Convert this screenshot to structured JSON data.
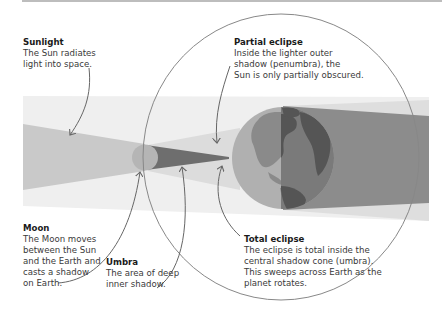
{
  "diagram": {
    "topic": "Solar eclipse",
    "colors": {
      "background": "#ffffff",
      "light_band": "#efefef",
      "sunlight": "#c9c9c9",
      "penumbra": "#dcdcdc",
      "umbra": "#6e6e6e",
      "moon": "#b5b5b5",
      "earth_lit": "#b0b0b0",
      "earth_land_lit": "#8a8a8a",
      "earth_shadow": "#7a7a7a",
      "earth_land_shadow": "#555555",
      "shadow_dark": "#8c8c8c",
      "shadow_light": "#dedede",
      "arrows": "#666666",
      "top_rule": "#bdbdbd"
    }
  },
  "labels": {
    "sunlight": {
      "title": "Sunlight",
      "body": "The Sun radiates\nlight into space."
    },
    "partial": {
      "title": "Partial eclipse",
      "body": "Inside the lighter outer\nshadow (penumbra), the\nSun is only partially obscured."
    },
    "moon": {
      "title": "Moon",
      "body": "The Moon moves\nbetween the Sun\nand the Earth and\ncasts a shadow\non Earth."
    },
    "umbra": {
      "title": "Umbra",
      "body": "The area of deep\ninner shadow."
    },
    "total": {
      "title": "Total eclipse",
      "body": "The eclipse is total inside the\ncentral shadow cone (umbra).\nThis sweeps across Earth as the\nplanet rotates."
    }
  }
}
